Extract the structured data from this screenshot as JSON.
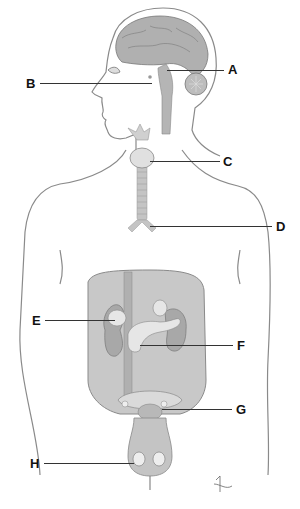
{
  "diagram": {
    "type": "anatomical-labeling",
    "colors": {
      "outline": "#8a8a8a",
      "organ_fill": "#b5b5b5",
      "abdomen_fill": "#c8c8c8",
      "gland_fill": "#e2e2e2",
      "leader_line": "#333333",
      "label_text": "#111111",
      "background": "#ffffff"
    },
    "labels": [
      {
        "id": "A",
        "text": "A",
        "target": "pineal/brain region",
        "x": 228,
        "y": 63
      },
      {
        "id": "B",
        "text": "B",
        "target": "pituitary gland",
        "x": 26,
        "y": 77
      },
      {
        "id": "C",
        "text": "C",
        "target": "thyroid gland",
        "x": 223,
        "y": 155
      },
      {
        "id": "D",
        "text": "D",
        "target": "thymus/trachea branch",
        "x": 276,
        "y": 221
      },
      {
        "id": "E",
        "text": "E",
        "target": "adrenal gland",
        "x": 32,
        "y": 314
      },
      {
        "id": "F",
        "text": "F",
        "target": "pancreas",
        "x": 237,
        "y": 339
      },
      {
        "id": "G",
        "text": "G",
        "target": "pelvic gland",
        "x": 236,
        "y": 403
      },
      {
        "id": "H",
        "text": "H",
        "target": "testes",
        "x": 30,
        "y": 457
      }
    ],
    "signature": "artist-signature"
  }
}
